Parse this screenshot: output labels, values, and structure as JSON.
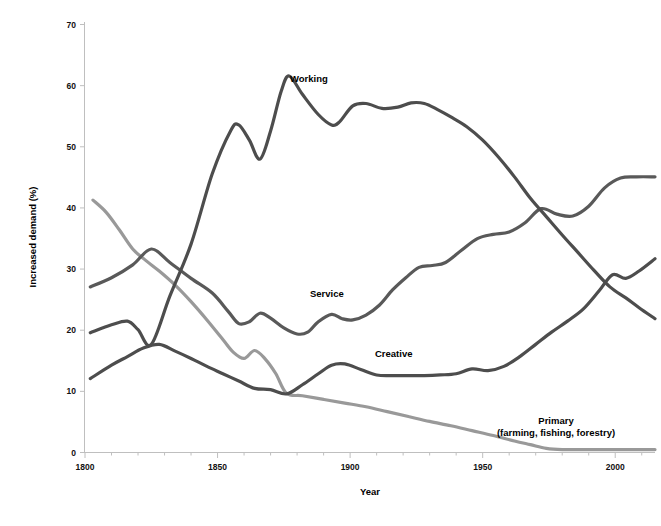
{
  "chart_data": {
    "type": "line",
    "title": "",
    "xlabel": "Year",
    "ylabel": "Increased demand (%)",
    "xlim": [
      1800,
      2015
    ],
    "ylim": [
      0,
      70
    ],
    "xticks": [
      1800,
      1850,
      1900,
      1950,
      2000
    ],
    "yticks": [
      0,
      10,
      20,
      30,
      40,
      50,
      60,
      70
    ],
    "grid": false,
    "legend": "inline-labels",
    "series": [
      {
        "name": "Working",
        "color": "#4d4d4d",
        "label_text": "Working",
        "x": [
          1802,
          1810,
          1816,
          1820,
          1825,
          1832,
          1840,
          1848,
          1855,
          1858,
          1862,
          1866,
          1870,
          1874,
          1877,
          1882,
          1888,
          1893,
          1896,
          1901,
          1906,
          1912,
          1918,
          1923,
          1928,
          1933,
          1938,
          1944,
          1950,
          1956,
          1962,
          1968,
          1974,
          1980,
          1986,
          1992,
          1998,
          2004,
          2009,
          2015
        ],
        "y": [
          19.5,
          20.8,
          21.4,
          20.0,
          17.6,
          25.5,
          34.0,
          45.5,
          52.6,
          53.5,
          51.0,
          47.9,
          52.5,
          59.0,
          61.5,
          58.5,
          55.2,
          53.5,
          54.0,
          56.6,
          57.0,
          56.2,
          56.4,
          57.1,
          57.0,
          56.0,
          54.8,
          53.2,
          51.0,
          48.2,
          45.0,
          41.5,
          38.5,
          35.5,
          32.6,
          29.7,
          27.0,
          25.2,
          23.6,
          21.8
        ]
      },
      {
        "name": "Service",
        "color": "#595959",
        "label_text": "Service",
        "x": [
          1802,
          1810,
          1818,
          1825,
          1832,
          1840,
          1848,
          1854,
          1858,
          1862,
          1866,
          1870,
          1875,
          1880,
          1884,
          1888,
          1893,
          1897,
          1901,
          1906,
          1911,
          1916,
          1921,
          1926,
          1931,
          1936,
          1942,
          1948,
          1954,
          1960,
          1966,
          1972,
          1978,
          1984,
          1990,
          1996,
          2002,
          2008,
          2015
        ],
        "y": [
          27.0,
          28.5,
          30.6,
          33.2,
          31.0,
          28.4,
          26.0,
          23.0,
          21.0,
          21.3,
          22.7,
          21.9,
          20.3,
          19.3,
          19.6,
          21.3,
          22.5,
          21.8,
          21.6,
          22.4,
          24.0,
          26.5,
          28.5,
          30.2,
          30.5,
          31.0,
          33.0,
          34.9,
          35.6,
          36.0,
          37.5,
          39.8,
          38.9,
          38.6,
          40.2,
          43.2,
          44.8,
          45.0,
          45.0
        ]
      },
      {
        "name": "Creative",
        "color": "#4d4d4d",
        "label_text": "Creative",
        "x": [
          1802,
          1810,
          1816,
          1822,
          1828,
          1834,
          1840,
          1846,
          1852,
          1858,
          1864,
          1870,
          1876,
          1882,
          1888,
          1893,
          1898,
          1904,
          1910,
          1916,
          1922,
          1928,
          1934,
          1940,
          1946,
          1952,
          1958,
          1964,
          1970,
          1976,
          1982,
          1988,
          1994,
          1999,
          2004,
          2009,
          2015
        ],
        "y": [
          12.0,
          14.2,
          15.6,
          17.0,
          17.6,
          16.5,
          15.3,
          14.0,
          12.8,
          11.6,
          10.4,
          10.2,
          9.5,
          11.0,
          12.8,
          14.2,
          14.4,
          13.5,
          12.6,
          12.5,
          12.5,
          12.5,
          12.6,
          12.8,
          13.6,
          13.3,
          14.0,
          15.6,
          17.6,
          19.6,
          21.4,
          23.4,
          26.4,
          29.0,
          28.4,
          29.6,
          31.6
        ]
      },
      {
        "name": "Primary (farming, fishing, forestry)",
        "color": "#999999",
        "label_text": "Primary",
        "label_text2": "(farming, fishing, forestry)",
        "x": [
          1803,
          1808,
          1813,
          1818,
          1823,
          1828,
          1834,
          1840,
          1846,
          1852,
          1856,
          1860,
          1864,
          1868,
          1872,
          1876,
          1882,
          1890,
          1898,
          1906,
          1914,
          1922,
          1930,
          1938,
          1946,
          1954,
          1962,
          1968,
          1974,
          1980,
          1990,
          2000,
          2015
        ],
        "y": [
          41.2,
          39.2,
          36.3,
          33.2,
          31.3,
          29.6,
          27.3,
          24.6,
          21.6,
          18.4,
          16.3,
          15.3,
          16.6,
          15.2,
          12.8,
          9.6,
          9.2,
          8.6,
          8.0,
          7.4,
          6.6,
          5.8,
          5.0,
          4.3,
          3.5,
          2.7,
          1.8,
          1.2,
          0.6,
          0.4,
          0.4,
          0.4,
          0.4
        ]
      }
    ]
  },
  "labels": {
    "working": "Working",
    "service": "Service",
    "creative": "Creative",
    "primary_line1": "Primary",
    "primary_line2": "(farming, fishing, forestry)",
    "x_axis_title": "Year",
    "y_axis_title": "Increased demand (%)"
  },
  "axis": {
    "yticks": [
      "70",
      "60",
      "50",
      "40",
      "30",
      "20",
      "10",
      "0"
    ],
    "xticks": [
      "1800",
      "1850",
      "1900",
      "1950",
      "2000"
    ]
  }
}
